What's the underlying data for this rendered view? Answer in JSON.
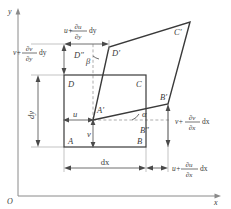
{
  "figure": {
    "axes": {
      "x_label": "x",
      "y_label": "y",
      "origin_label": "O"
    },
    "undeformed_vertices": {
      "A": "A",
      "B": "B",
      "C": "C",
      "D": "D"
    },
    "deformed_vertices": {
      "A_prime": "A′",
      "B_prime": "B′",
      "C_prime": "C′",
      "D_prime": "D′"
    },
    "projection_points": {
      "B_dprime": "B″",
      "D_dprime": "D″"
    },
    "angles": {
      "alpha": "α",
      "beta": "β"
    },
    "displacements": {
      "u": "u",
      "v": "v"
    },
    "dimensions": {
      "dx": "dx",
      "dy": "dy"
    },
    "expressions": {
      "u_plus_du_dy": {
        "lead": "u+",
        "numerator": "∂u",
        "denominator": "∂y",
        "trail": "dy"
      },
      "v_plus_dv_dy": {
        "lead": "v+",
        "numerator": "∂v",
        "denominator": "∂y",
        "trail": "dy"
      },
      "v_plus_dv_dx": {
        "lead": "v+",
        "numerator": "∂v",
        "denominator": "∂x",
        "trail": "dx"
      },
      "u_plus_du_dx": {
        "lead": "u+",
        "numerator": "∂u",
        "denominator": "∂x",
        "trail": "dx"
      }
    },
    "colors": {
      "stroke": "#3a3a3a",
      "thin_stroke": "#8a8a8a",
      "background": "#ffffff"
    }
  }
}
